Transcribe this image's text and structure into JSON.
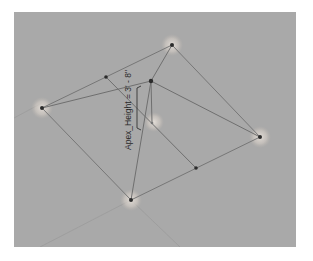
{
  "viewport": {
    "background": "#a9a9a9",
    "edge_color": "#777777",
    "point_color": "#2b2b2b",
    "grip_color": "#d9d3cd"
  },
  "annotation": {
    "dimension_label": "Apex_Height = 3' - 8\""
  },
  "geometry": {
    "vertices": [
      {
        "name": "top",
        "x": 172,
        "y": 45
      },
      {
        "name": "left",
        "x": 42,
        "y": 103
      },
      {
        "name": "right",
        "x": 260,
        "y": 137
      },
      {
        "name": "bottom",
        "x": 131,
        "y": 200
      }
    ],
    "apex": {
      "x": 151,
      "y": 81
    },
    "base_center": {
      "x": 152,
      "y": 123
    },
    "midpoints": [
      {
        "x": 106,
        "y": 77
      },
      {
        "x": 196,
        "y": 168
      }
    ]
  }
}
